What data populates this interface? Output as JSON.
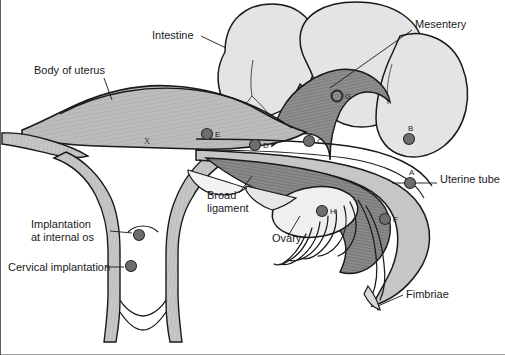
{
  "figure": {
    "type": "anatomical-diagram",
    "background_color": "#ffffff",
    "outline_color": "#1a1a1a",
    "palette": {
      "uterus_myometrium": "#b9b9b9",
      "uterus_wall_light": "#c9c9c9",
      "intestine_fill": "#e3e3e3",
      "mesosalpinx_dark": "#8e8e8e",
      "tube_muscle": "#8a8a8a",
      "ovary_fill": "#eeeeee",
      "marker_fill": "#6e6e6e",
      "marker_stroke": "#2a2a2a",
      "label_text": "#1a1a1a"
    }
  },
  "labels": [
    {
      "id": "intestine",
      "text": "Intestine",
      "x": 152,
      "y": 39,
      "anchor": "start"
    },
    {
      "id": "mesentery",
      "text": "Mesentery",
      "x": 415,
      "y": 28,
      "anchor": "start"
    },
    {
      "id": "body-uterus",
      "text": "Body of uterus",
      "x": 34,
      "y": 74,
      "anchor": "start"
    },
    {
      "id": "uterine-tube",
      "text": "Uterine tube",
      "x": 440,
      "y": 183,
      "anchor": "start"
    },
    {
      "id": "broad-lig-1",
      "text": "Broad",
      "x": 207,
      "y": 199,
      "anchor": "start"
    },
    {
      "id": "broad-lig-2",
      "text": "ligament",
      "x": 207,
      "y": 212,
      "anchor": "start"
    },
    {
      "id": "ovary",
      "text": "Ovary",
      "x": 272,
      "y": 242,
      "anchor": "start"
    },
    {
      "id": "implant-1",
      "text": "Implantation",
      "x": 31,
      "y": 228,
      "anchor": "start"
    },
    {
      "id": "implant-2",
      "text": "at internal os",
      "x": 31,
      "y": 241,
      "anchor": "start"
    },
    {
      "id": "cervical",
      "text": "Cervical implantation",
      "x": 8,
      "y": 271,
      "anchor": "start"
    },
    {
      "id": "fimbriae",
      "text": "Fimbriae",
      "x": 406,
      "y": 298,
      "anchor": "start"
    }
  ],
  "markers": [
    {
      "id": "A",
      "letter": "A",
      "x": 410,
      "y": 183,
      "r": 5.5,
      "style": "filled",
      "label_dx": -1,
      "label_dy": -8
    },
    {
      "id": "B",
      "letter": "B",
      "x": 409,
      "y": 139,
      "r": 5.5,
      "style": "filled",
      "label_dx": -1,
      "label_dy": -8
    },
    {
      "id": "C",
      "letter": "C",
      "x": 309,
      "y": 141,
      "r": 5.5,
      "style": "filled",
      "label_dx": 8,
      "label_dy": 3
    },
    {
      "id": "D",
      "letter": "D",
      "x": 255,
      "y": 145,
      "r": 5.5,
      "style": "filled",
      "label_dx": 8,
      "label_dy": 3
    },
    {
      "id": "E",
      "letter": "E",
      "x": 207,
      "y": 134,
      "r": 5.5,
      "style": "filled",
      "label_dx": 8,
      "label_dy": 3
    },
    {
      "id": "F",
      "letter": "F",
      "x": 385,
      "y": 219,
      "r": 5.5,
      "style": "filled",
      "label_dx": 8,
      "label_dy": 3
    },
    {
      "id": "G",
      "letter": "G",
      "x": 337,
      "y": 96,
      "r": 5.5,
      "style": "ring",
      "label_dx": 8,
      "label_dy": 3
    },
    {
      "id": "H",
      "letter": "H",
      "x": 322,
      "y": 211,
      "r": 5.5,
      "style": "filled",
      "label_dx": 8,
      "label_dy": 3
    },
    {
      "id": "I",
      "letter": "I",
      "x": 139,
      "y": 235,
      "r": 5.5,
      "style": "filled",
      "label_dx": 0,
      "label_dy": 0
    },
    {
      "id": "J",
      "letter": "J",
      "x": 131,
      "y": 266,
      "r": 5.5,
      "style": "filled",
      "label_dx": 0,
      "label_dy": 0
    }
  ],
  "cavity_marker": {
    "letter": "X",
    "x": 147,
    "y": 144
  }
}
